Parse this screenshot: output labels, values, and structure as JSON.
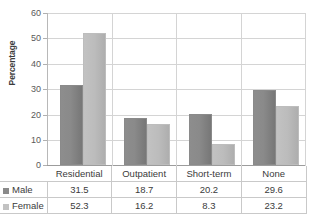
{
  "chart_data": {
    "type": "bar",
    "title": "",
    "xlabel": "",
    "ylabel": "Percentage",
    "ylim": [
      0,
      60
    ],
    "yticks": [
      0,
      10,
      20,
      30,
      40,
      50,
      60
    ],
    "grid": true,
    "legend_position": "table-left",
    "categories": [
      "Residential",
      "Outpatient",
      "Short-term",
      "None"
    ],
    "series": [
      {
        "name": "Male",
        "color": "#8a8a8a",
        "values": [
          31.5,
          18.7,
          20.2,
          29.6
        ]
      },
      {
        "name": "Female",
        "color": "#c2c2c2",
        "values": [
          52.3,
          16.2,
          8.3,
          23.2
        ]
      }
    ]
  },
  "axis": {
    "y_title": "Percentage",
    "ticks": [
      {
        "label": "60"
      },
      {
        "label": "50"
      },
      {
        "label": "40"
      },
      {
        "label": "30"
      },
      {
        "label": "20"
      },
      {
        "label": "10"
      },
      {
        "label": "0"
      }
    ]
  },
  "table": {
    "corner": "",
    "headers": [
      "Residential",
      "Outpatient",
      "Short-term",
      "None"
    ],
    "rows": [
      {
        "label": "Male",
        "values": [
          "31.5",
          "18.7",
          "20.2",
          "29.6"
        ]
      },
      {
        "label": "Female",
        "values": [
          "52.3",
          "16.2",
          "8.3",
          "23.2"
        ]
      }
    ]
  }
}
